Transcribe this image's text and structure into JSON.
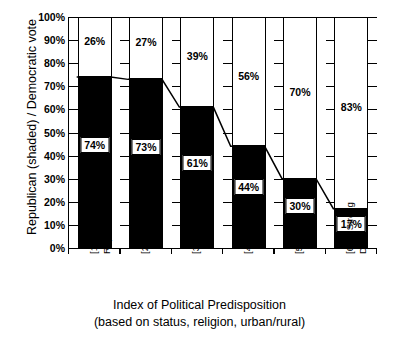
{
  "chart_data": {
    "type": "bar",
    "subtype": "stacked-100-percent",
    "title": "",
    "xlabel": "Index of Political Predisposition",
    "xlabel_sub": "(based on status, religion, urban/rural)",
    "ylabel": "Republican (shaded) / Democratic vote",
    "ylim": [
      0,
      100
    ],
    "ytick_labels": [
      "100%",
      "90%",
      "80%",
      "70%",
      "60%",
      "50%",
      "40%",
      "30%",
      "20%",
      "10%",
      "0%"
    ],
    "ytick_values": [
      100,
      90,
      80,
      70,
      60,
      50,
      40,
      30,
      20,
      10,
      0
    ],
    "grid": true,
    "legend": "none",
    "categories": [
      {
        "line1": "[1] Strong",
        "line2": "Rep."
      },
      {
        "line1": "[2]",
        "line2": ""
      },
      {
        "line1": "[3]",
        "line2": ""
      },
      {
        "line1": "[4]",
        "line2": ""
      },
      {
        "line1": "[5]",
        "line2": ""
      },
      {
        "line1": "[6, 7] Strong",
        "line2": "Dem."
      }
    ],
    "series": [
      {
        "name": "Republican (shaded)",
        "color": "#000000",
        "values": [
          74,
          73,
          61,
          44,
          30,
          17
        ],
        "labels": [
          "74%",
          "73%",
          "61%",
          "44%",
          "30%",
          "17%"
        ]
      },
      {
        "name": "Democratic vote",
        "color": "#ffffff",
        "values": [
          26,
          27,
          39,
          56,
          70,
          83
        ],
        "labels": [
          "26%",
          "27%",
          "39%",
          "56%",
          "70%",
          "83%"
        ]
      }
    ],
    "connector_line": {
      "present": true,
      "color": "#000000",
      "values": [
        74,
        73,
        61,
        44,
        30,
        17
      ]
    }
  }
}
